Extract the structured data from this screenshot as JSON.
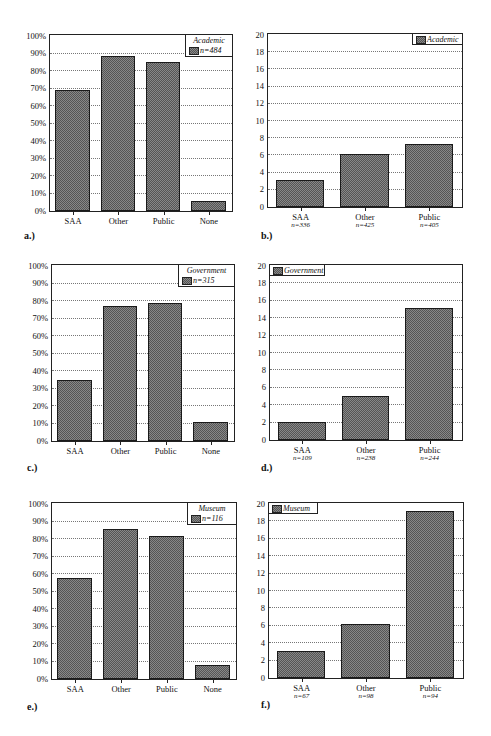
{
  "chart_data": [
    {
      "id": "a",
      "panel_label": "a.)",
      "type": "bar",
      "categories": [
        "SAA",
        "Other",
        "Public",
        "None"
      ],
      "values": [
        69,
        88.5,
        85,
        6
      ],
      "legend": {
        "title": "Academic",
        "series": "n=484"
      },
      "ylabel": "",
      "xlabel": "",
      "yticks": [
        "0%",
        "10%",
        "20%",
        "30%",
        "40%",
        "50%",
        "60%",
        "70%",
        "80%",
        "90%",
        "100%"
      ],
      "ylim": [
        0,
        100
      ],
      "grid": true,
      "legend_position": "top-right"
    },
    {
      "id": "b",
      "panel_label": "b.)",
      "type": "bar",
      "categories": [
        "SAA",
        "Other",
        "Public"
      ],
      "category_n": [
        "n=336",
        "n=425",
        "n=405"
      ],
      "values": [
        3.1,
        6.2,
        7.3
      ],
      "legend": {
        "title": "",
        "series": "Academic"
      },
      "yticks": [
        "0",
        "2",
        "4",
        "6",
        "8",
        "10",
        "12",
        "14",
        "16",
        "18",
        "20"
      ],
      "ylim": [
        0,
        20
      ],
      "grid": true,
      "legend_position": "top-right"
    },
    {
      "id": "c",
      "panel_label": "c.)",
      "type": "bar",
      "categories": [
        "SAA",
        "Other",
        "Public",
        "None"
      ],
      "values": [
        35,
        77,
        79,
        11
      ],
      "legend": {
        "title": "Government",
        "series": "n=315"
      },
      "yticks": [
        "0%",
        "10%",
        "20%",
        "30%",
        "40%",
        "50%",
        "60%",
        "70%",
        "80%",
        "90%",
        "100%"
      ],
      "ylim": [
        0,
        100
      ],
      "grid": true,
      "legend_position": "top-right"
    },
    {
      "id": "d",
      "panel_label": "d.)",
      "type": "bar",
      "categories": [
        "SAA",
        "Other",
        "Public"
      ],
      "category_n": [
        "n=109",
        "n=238",
        "n=244"
      ],
      "values": [
        2.1,
        5.1,
        15.2
      ],
      "legend": {
        "title": "",
        "series": "Government"
      },
      "yticks": [
        "0",
        "2",
        "4",
        "6",
        "8",
        "10",
        "12",
        "14",
        "16",
        "18",
        "20"
      ],
      "ylim": [
        0,
        20
      ],
      "grid": true,
      "legend_position": "top-left"
    },
    {
      "id": "e",
      "panel_label": "e.)",
      "type": "bar",
      "categories": [
        "SAA",
        "Other",
        "Public",
        "None"
      ],
      "values": [
        58,
        86,
        82,
        8
      ],
      "legend": {
        "title": "Museum",
        "series": "n=116"
      },
      "yticks": [
        "0%",
        "10%",
        "20%",
        "30%",
        "40%",
        "50%",
        "60%",
        "70%",
        "80%",
        "90%",
        "100%"
      ],
      "ylim": [
        0,
        100
      ],
      "grid": true,
      "legend_position": "top-right"
    },
    {
      "id": "f",
      "panel_label": "f.)",
      "type": "bar",
      "categories": [
        "SAA",
        "Other",
        "Public"
      ],
      "category_n": [
        "n=67",
        "n=98",
        "n=94"
      ],
      "values": [
        3.1,
        6.2,
        19.2
      ],
      "legend": {
        "title": "",
        "series": "Museum"
      },
      "yticks": [
        "0",
        "2",
        "4",
        "6",
        "8",
        "10",
        "12",
        "14",
        "16",
        "18",
        "20"
      ],
      "ylim": [
        0,
        20
      ],
      "grid": true,
      "legend_position": "top-left"
    }
  ],
  "layout": [
    {
      "plot": [
        49,
        34,
        184,
        178
      ],
      "legend": [
        185,
        34,
        48,
        23
      ],
      "label": [
        24,
        230
      ]
    },
    {
      "plot": [
        267,
        33,
        196,
        175
      ],
      "legend": [
        412,
        33,
        51,
        12
      ],
      "label": [
        261,
        230
      ]
    },
    {
      "plot": [
        51,
        264,
        184,
        178
      ],
      "legend": [
        178,
        264,
        57,
        23
      ],
      "label": [
        27,
        462
      ]
    },
    {
      "plot": [
        269,
        264,
        194,
        177
      ],
      "legend": [
        269,
        264,
        56,
        12
      ],
      "label": [
        261,
        462
      ]
    },
    {
      "plot": [
        51,
        502,
        186,
        178
      ],
      "legend": [
        187,
        502,
        50,
        23
      ],
      "label": [
        27,
        701
      ]
    },
    {
      "plot": [
        268,
        502,
        196,
        177
      ],
      "legend": [
        268,
        502,
        50,
        12
      ],
      "label": [
        261,
        699
      ]
    }
  ]
}
